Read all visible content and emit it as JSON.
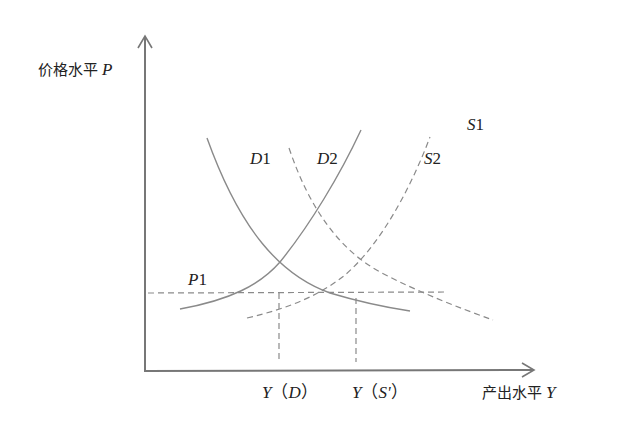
{
  "diagram": {
    "y_axis": {
      "label_cn": "价格水平",
      "label_var": "P"
    },
    "x_axis": {
      "label_cn": "产出水平",
      "label_var": "Y"
    },
    "curves": [
      {
        "id": "D1",
        "var": "D",
        "num": "1",
        "style": "solid",
        "slope": "downward"
      },
      {
        "id": "S1",
        "var": "S",
        "num": "1",
        "style": "solid",
        "slope": "upward"
      },
      {
        "id": "D2",
        "var": "D",
        "num": "2",
        "style": "dashed",
        "slope": "downward"
      },
      {
        "id": "S2",
        "var": "S",
        "num": "2",
        "style": "dashed",
        "slope": "upward"
      }
    ],
    "price_line": {
      "var": "P",
      "num": "1",
      "style": "dashed"
    },
    "x_markers": [
      {
        "var": "Y",
        "open": "（",
        "inner": "D",
        "close": "）"
      },
      {
        "var": "Y",
        "open": "（",
        "inner": "S'",
        "close": "）"
      }
    ],
    "colors": {
      "axis": "#777777",
      "curve": "#8a8a8a",
      "text": "#222222"
    }
  }
}
